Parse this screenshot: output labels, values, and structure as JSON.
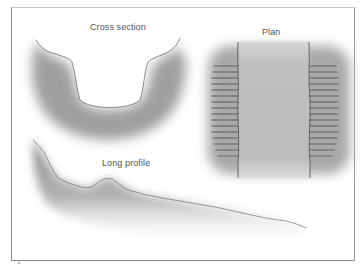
{
  "diagram": {
    "panels": [
      {
        "id": "cross-section",
        "label": "Cross section"
      },
      {
        "id": "plan",
        "label": "Plan"
      },
      {
        "id": "long-profile",
        "label": "Long profile"
      }
    ]
  },
  "colors": {
    "frame": "#8a8a8a",
    "shade_dark": "#8c8c8c",
    "shade_light": "#ffffff",
    "channel_fill": "#c4c4c4",
    "bank_line": "#4a4a4a",
    "text": "#555555"
  }
}
